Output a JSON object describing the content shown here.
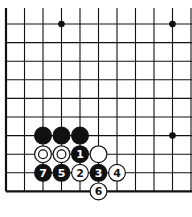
{
  "board": {
    "type": "go-diagram",
    "corner": "bottom-left",
    "grid": {
      "x_lines": [
        6,
        24.5,
        43,
        61.5,
        80,
        98.5,
        117,
        135.5,
        154,
        172.5,
        191
      ],
      "y_lines": [
        24,
        42.6,
        61.2,
        79.8,
        98.4,
        117,
        135.6,
        154.2,
        172.8,
        191.4
      ],
      "left_edge_top": 8,
      "line_color": "#111111",
      "edge_width": 2.2,
      "line_width": 1.1
    },
    "star_points": [
      {
        "col": 3,
        "row": 0
      },
      {
        "col": 9,
        "row": 0
      },
      {
        "col": 9,
        "row": 6
      }
    ],
    "stones": [
      {
        "color": "black",
        "col": 2,
        "row": 6,
        "label": ""
      },
      {
        "color": "black",
        "col": 3,
        "row": 6,
        "label": ""
      },
      {
        "color": "black",
        "col": 4,
        "row": 6,
        "label": ""
      },
      {
        "color": "white",
        "col": 2,
        "row": 7,
        "label": "",
        "marker": "circle"
      },
      {
        "color": "white",
        "col": 3,
        "row": 7,
        "label": "",
        "marker": "circle"
      },
      {
        "color": "black",
        "col": 4,
        "row": 7,
        "label": "1"
      },
      {
        "color": "white",
        "col": 5,
        "row": 7,
        "label": ""
      },
      {
        "color": "black",
        "col": 2,
        "row": 8,
        "label": "7"
      },
      {
        "color": "black",
        "col": 3,
        "row": 8,
        "label": "5"
      },
      {
        "color": "white",
        "col": 4,
        "row": 8,
        "label": "2"
      },
      {
        "color": "black",
        "col": 5,
        "row": 8,
        "label": "3"
      },
      {
        "color": "white",
        "col": 6,
        "row": 8,
        "label": "4"
      },
      {
        "color": "white",
        "col": 5,
        "row": 9,
        "label": "6"
      }
    ]
  }
}
